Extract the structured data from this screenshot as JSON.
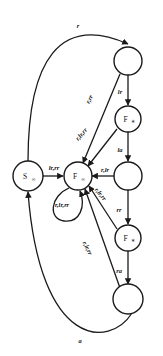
{
  "figure": {
    "type": "state-transition-diagram",
    "background": "#ffffff",
    "ink_color": "#1a1a1a"
  },
  "nodes": [
    {
      "id": "s_inf",
      "label": "S",
      "sub": "∞",
      "cx": 28,
      "cy": 176,
      "r": 15
    },
    {
      "id": "f_inf",
      "label": "F",
      "sub": "∞",
      "cx": 78,
      "cy": 176,
      "r": 14
    },
    {
      "id": "n_top",
      "label": "",
      "sub": "",
      "cx": 128,
      "cy": 61,
      "r": 14
    },
    {
      "id": "f_up",
      "label": "F",
      "sub": "∗",
      "cx": 128,
      "cy": 119,
      "r": 13
    },
    {
      "id": "n_mid",
      "label": "",
      "sub": "",
      "cx": 128,
      "cy": 176,
      "r": 14
    },
    {
      "id": "f_dn",
      "label": "F",
      "sub": "∗",
      "cx": 128,
      "cy": 238,
      "r": 13
    },
    {
      "id": "n_bot",
      "label": "",
      "sub": "",
      "cx": 128,
      "cy": 299,
      "r": 15
    }
  ],
  "edges": [
    {
      "id": "e_top_arc",
      "from": "s_inf",
      "to": "n_top",
      "label": "r",
      "lx": 78,
      "ly": 25
    },
    {
      "id": "e_bot_arc",
      "from": "n_bot",
      "to": "s_inf",
      "label": "a",
      "lx": 80,
      "ly": 340
    },
    {
      "id": "e_s_to_f",
      "from": "s_inf",
      "to": "f_inf",
      "label": "lr,rr",
      "lx": 54,
      "ly": 168
    },
    {
      "id": "e_f_selfloop",
      "from": "f_inf",
      "to": "f_inf",
      "label": "r,lr,rr",
      "lx": 62,
      "ly": 203
    },
    {
      "id": "e_top_to_fup",
      "from": "n_top",
      "to": "f_up",
      "label": "lr",
      "lx": 120,
      "ly": 91
    },
    {
      "id": "e_fup_to_mid",
      "from": "f_up",
      "to": "n_mid",
      "label": "la",
      "lx": 120,
      "ly": 149
    },
    {
      "id": "e_mid_to_fdn",
      "from": "n_mid",
      "to": "f_dn",
      "label": "rr",
      "lx": 120,
      "ly": 208
    },
    {
      "id": "e_fdn_to_bot",
      "from": "f_dn",
      "to": "n_bot",
      "label": "ra",
      "lx": 120,
      "ly": 270
    },
    {
      "id": "e_top_to_finf",
      "from": "n_top",
      "to": "f_inf",
      "label": "r,rr",
      "lx": 88,
      "ly": 98
    },
    {
      "id": "e_fup_to_finf",
      "from": "f_up",
      "to": "f_inf",
      "label": "r,lr,rr",
      "lx": 82,
      "ly": 136
    },
    {
      "id": "e_mid_to_finf",
      "from": "n_mid",
      "to": "f_inf",
      "label": "r,lr",
      "lx": 106,
      "ly": 170
    },
    {
      "id": "e_fdn_to_finf",
      "from": "f_dn",
      "to": "f_inf",
      "label": "r,lr,rr",
      "lx": 100,
      "ly": 193
    },
    {
      "id": "e_bot_to_finf",
      "from": "n_bot",
      "to": "f_inf",
      "label": "r,lr,rr",
      "lx": 88,
      "ly": 248
    }
  ]
}
